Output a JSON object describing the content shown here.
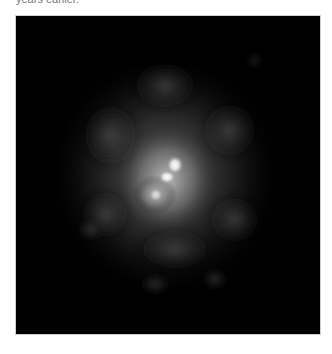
{
  "caption": {
    "text": "years earlier."
  },
  "image": {
    "subject": "astronomical-object-diffuse-glow",
    "background_color": "#000000",
    "glow_color": "#ffffff",
    "core_highlights": 2
  }
}
